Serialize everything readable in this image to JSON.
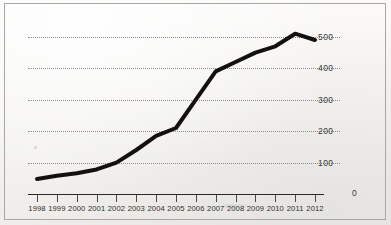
{
  "chart_data": {
    "type": "line",
    "title": "",
    "xlabel": "",
    "ylabel": "",
    "x": [
      1998,
      1999,
      2000,
      2001,
      2002,
      2003,
      2004,
      2005,
      2006,
      2007,
      2008,
      2009,
      2010,
      2011,
      2012
    ],
    "categories": [
      "1998",
      "1999",
      "2000",
      "2001",
      "2002",
      "2003",
      "2004",
      "2005",
      "2006",
      "2007",
      "2008",
      "2009",
      "2010",
      "2011",
      "2012"
    ],
    "values": [
      48,
      58,
      66,
      78,
      100,
      140,
      185,
      210,
      300,
      390,
      420,
      450,
      470,
      510,
      490
    ],
    "series": [
      {
        "name": "series-1",
        "values": [
          48,
          58,
          66,
          78,
          100,
          140,
          185,
          210,
          300,
          390,
          420,
          450,
          470,
          510,
          490
        ]
      }
    ],
    "ylim": [
      0,
      560
    ],
    "xlim": [
      1998,
      2012
    ],
    "yticks": [
      0,
      100,
      200,
      300,
      400,
      500
    ],
    "ytick_labels": [
      "0",
      "100",
      "200",
      "300",
      "400",
      "500"
    ],
    "grid": "horizontal-dotted",
    "legend": "none",
    "line_color": "#121110",
    "line_width": 4,
    "background_color": "#f7f6f4",
    "grid_color": "#7d7b79",
    "axis_color": "#2a2927",
    "text_color": "#2f2e2c",
    "border_color": "#a9a7a4"
  }
}
